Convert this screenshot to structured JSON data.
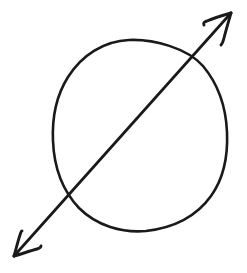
{
  "figure": {
    "title": "Hand-drawn circle crossed by a diagonal double-headed arrow",
    "background_color": "#ffffff",
    "ink_color": "#1a1a1a",
    "canvas": {
      "width": 247,
      "height": 273
    },
    "elements": [
      {
        "name": "hand-drawn-circle",
        "label": "Circle",
        "stroke_color": "#1a1a1a",
        "stroke_width": 2.6,
        "bounds": {
          "left": 53,
          "top": 40,
          "right": 228,
          "bottom": 231
        },
        "path": "M 129 40 C 104 41 82 55 68 77 C 56 96 52 119 53 141 C 54 166 62 190 79 208 C 97 226 122 233 146 231 C 172 228 196 217 211 196 C 224 178 228 155 227 132 C 226 108 218 84 203 66 C 187 48 154 39 129 40 Z"
      },
      {
        "name": "arrow-shaft",
        "label": "Diagonal double-headed arrow shaft",
        "stroke_color": "#1a1a1a",
        "stroke_width": 2.7,
        "from": {
          "x": 13,
          "y": 257
        },
        "to": {
          "x": 232,
          "y": 12
        },
        "path": "M 14 256 L 231 13"
      },
      {
        "name": "arrowhead-upper-right",
        "label": "Upper-right arrowhead",
        "direction": "up-right",
        "tip": {
          "x": 232,
          "y": 12
        },
        "stroke_color": "#1a1a1a",
        "stroke_width": 2.9,
        "barb_left_path": "M 231 13 C 224 15 214 18 207 21 C 204 22 203 23 204 25",
        "barb_right_path": "M 231 13 C 229 20 226 30 224 38 C 223 42 222 44 221 45"
      },
      {
        "name": "arrowhead-lower-left",
        "label": "Lower-left arrowhead",
        "direction": "down-left",
        "tip": {
          "x": 13,
          "y": 257
        },
        "stroke_color": "#1a1a1a",
        "stroke_width": 2.9,
        "barb_up_path": "M 14 256 C 16 249 18 241 20 235 C 21 232 21 231 22 231",
        "barb_right_path": "M 14 256 C 21 254 30 251 37 249 C 40 248 41 247 41 246"
      }
    ],
    "intersections": [
      {
        "name": "upper-right-crossing",
        "x": 188,
        "y": 62
      },
      {
        "name": "lower-left-crossing",
        "x": 70,
        "y": 192
      }
    ]
  }
}
